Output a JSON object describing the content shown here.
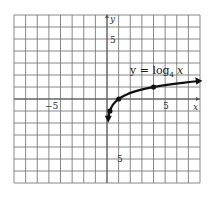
{
  "chart_data": {
    "type": "line",
    "title": "",
    "xlabel": "x",
    "ylabel": "y",
    "xlim": [
      -8,
      8
    ],
    "ylim": [
      -7,
      7
    ],
    "grid": true,
    "tick_labels": {
      "x": [
        "-5",
        "5"
      ],
      "y": [
        "5",
        "-5"
      ]
    },
    "annotation": {
      "text_main": "y = log",
      "subscript": "4",
      "text_var": " x"
    },
    "series": [
      {
        "name": "y = log4 x",
        "function": "log4(x)",
        "marked_points": [
          [
            0.25,
            -1
          ],
          [
            1,
            0
          ],
          [
            4,
            1
          ]
        ],
        "arrows": [
          "down near x=0",
          "right toward x=8"
        ],
        "x": [
          0.11,
          0.25,
          0.5,
          1,
          2,
          4,
          8
        ],
        "values": [
          -1.6,
          -1,
          -0.5,
          0,
          0.5,
          1,
          1.5
        ]
      }
    ]
  },
  "labels": {
    "x_axis": "x",
    "y_axis": "y",
    "x_tick_neg": "−5",
    "x_tick_pos": "5",
    "y_tick_pos": "5",
    "y_tick_neg": "5",
    "eq_main": "y = log",
    "eq_sub": "4",
    "eq_var": "x"
  }
}
